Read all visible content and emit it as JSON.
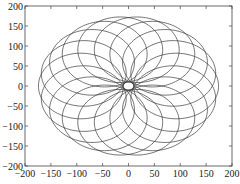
{
  "chart_data": {
    "type": "line",
    "title": "",
    "xlabel": "",
    "ylabel": "",
    "xlim": [
      -200,
      200
    ],
    "ylim": [
      -200,
      200
    ],
    "grid": false,
    "legend": null,
    "x_ticks": [
      -200,
      -150,
      -100,
      -50,
      0,
      50,
      100,
      150,
      200
    ],
    "y_ticks": [
      200,
      150,
      100,
      50,
      0,
      -50,
      -100,
      -150,
      -200
    ],
    "x_tick_labels": [
      "−200",
      "−150",
      "−100",
      "−50",
      "0",
      "50",
      "100",
      "150",
      "200"
    ],
    "y_tick_labels": [
      "200",
      "150",
      "100",
      "50",
      "0",
      "−50",
      "−100",
      "−150",
      "−200"
    ],
    "series": [
      {
        "name": "circle-family",
        "count": 18,
        "circle_radius": 82,
        "center_distance": 92,
        "outer_radius": 174,
        "inner_hole_radius": 10,
        "color": "#3a3a3a"
      }
    ]
  }
}
